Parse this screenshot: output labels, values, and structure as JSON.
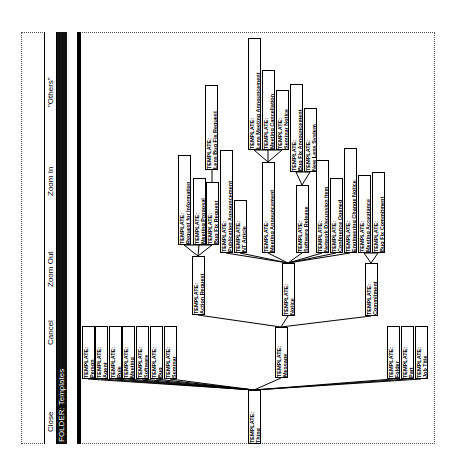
{
  "window": {
    "title": "FOLDER: Templates",
    "menu": [
      {
        "id": "close",
        "label": "Close"
      },
      {
        "id": "cancel",
        "label": "Cancel"
      },
      {
        "id": "zoom-out",
        "label": "Zoom Out"
      },
      {
        "id": "zoom-in",
        "label": "Zoom In"
      },
      {
        "id": "others",
        "label": "\"Others\""
      }
    ]
  },
  "tree": {
    "prefix": "TEMPLATE:",
    "nodes": [
      {
        "id": "thing",
        "name": "Thing",
        "parent": null
      },
      {
        "id": "person",
        "name": "Person",
        "parent": "thing"
      },
      {
        "id": "agent",
        "name": "Agent",
        "parent": "thing"
      },
      {
        "id": "rule",
        "name": "Rule",
        "parent": "thing"
      },
      {
        "id": "meeting",
        "name": "Meeting",
        "parent": "thing"
      },
      {
        "id": "software",
        "name": "Software",
        "parent": "thing"
      },
      {
        "id": "bug",
        "name": "Bug",
        "parent": "thing"
      },
      {
        "id": "seminar",
        "name": "Seminar",
        "parent": "thing"
      },
      {
        "id": "message",
        "name": "Message",
        "parent": "thing"
      },
      {
        "id": "folder",
        "name": "Folder",
        "parent": "thing"
      },
      {
        "id": "part",
        "name": "Part",
        "parent": "thing"
      },
      {
        "id": "job-title",
        "name": "Job Title",
        "parent": "thing"
      },
      {
        "id": "action-request",
        "name": "Action Request",
        "parent": "message"
      },
      {
        "id": "notice",
        "name": "Notice",
        "parent": "message"
      },
      {
        "id": "commitment",
        "name": "Commitment",
        "parent": "message"
      },
      {
        "id": "request-for-information",
        "name": "Request for Information",
        "parent": "action-request"
      },
      {
        "id": "meeting-proposal",
        "name": "Meeting Proposal",
        "parent": "action-request"
      },
      {
        "id": "bug-fix-request",
        "name": "Bug Fix Request",
        "parent": "action-request"
      },
      {
        "id": "lens-bug-fix-request",
        "name": "Lens Bug Fix Request",
        "parent": "bug-fix-request"
      },
      {
        "id": "publication-announcement",
        "name": "Publication Announcement",
        "parent": "notice"
      },
      {
        "id": "nt-article",
        "name": "NT Article",
        "parent": "notice"
      },
      {
        "id": "meeting-announcement",
        "name": "Meeting Announcement",
        "parent": "notice"
      },
      {
        "id": "lens-meeting-announcement",
        "name": "Lens Meeting Announcement",
        "parent": "meeting-announcement"
      },
      {
        "id": "meeting-cancellation",
        "name": "Meeting Cancellation",
        "parent": "meeting-announcement"
      },
      {
        "id": "seminar-notice",
        "name": "Seminar Notice",
        "parent": "meeting-announcement"
      },
      {
        "id": "software-release",
        "name": "Software Release",
        "parent": "notice"
      },
      {
        "id": "bug-fix-announcement",
        "name": "Bug Fix Announcement",
        "parent": "software-release"
      },
      {
        "id": "new-lens-system",
        "name": "New Lens System",
        "parent": "software-release"
      },
      {
        "id": "network-discussion-item",
        "name": "Network Discussion Item",
        "parent": "notice"
      },
      {
        "id": "conference-opened",
        "name": "Conference Opened",
        "parent": "notice"
      },
      {
        "id": "engineering-change-notice",
        "name": "Engineering Change Notice",
        "parent": "notice"
      },
      {
        "id": "meeting-acceptance",
        "name": "Meeting Acceptance",
        "parent": "commitment"
      },
      {
        "id": "bug-fix-commitment",
        "name": "Bug Fix Commitment",
        "parent": "commitment"
      }
    ]
  }
}
